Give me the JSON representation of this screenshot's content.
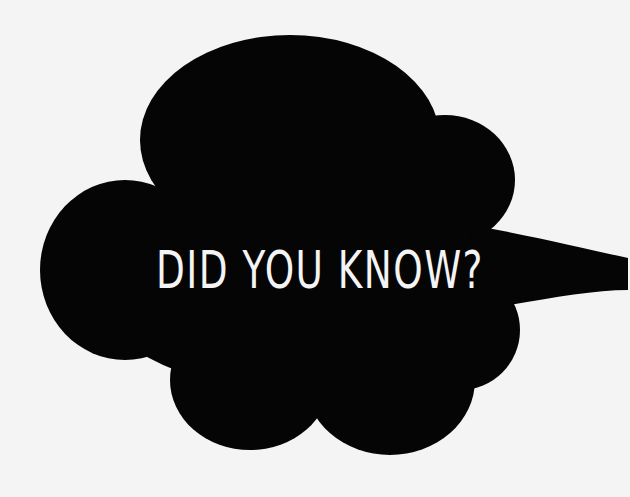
{
  "bubble": {
    "text": "DID YOU KNOW?",
    "fill_color": "#050505",
    "text_color": "#f4f4f4",
    "background_color": "#f4f4f4"
  }
}
